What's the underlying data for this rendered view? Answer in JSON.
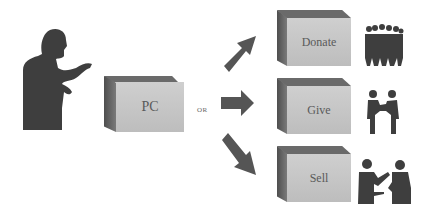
{
  "diagram": {
    "source": {
      "label": "PC",
      "icon": "person-at-computer-silhouette"
    },
    "connector_label": "OR",
    "options": [
      {
        "label": "Donate",
        "icon": "crowd-silhouette"
      },
      {
        "label": "Give",
        "icon": "handing-over-silhouette"
      },
      {
        "label": "Sell",
        "icon": "sale-exchange-silhouette"
      }
    ],
    "colors": {
      "box_face": "#c6c6c6",
      "box_shadow": "#5a5a5a",
      "silhouette": "#3e3e3e",
      "arrow": "#555555"
    }
  }
}
